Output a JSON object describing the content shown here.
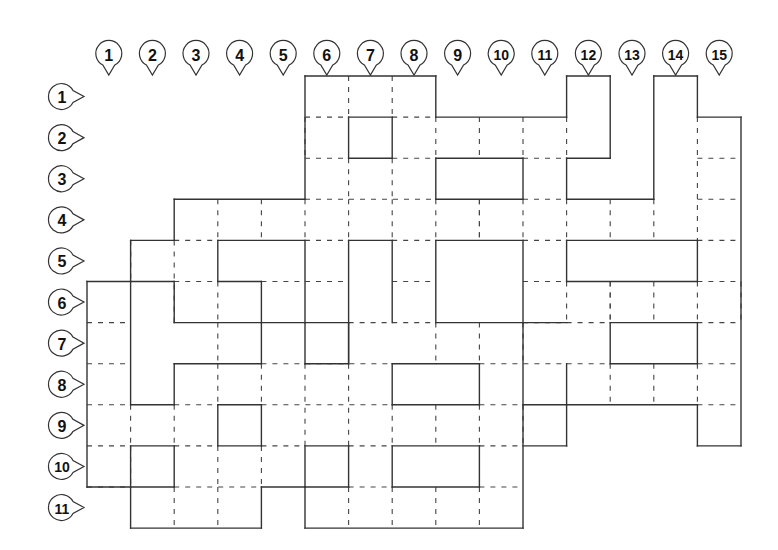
{
  "diagram": {
    "type": "seating-grid",
    "grid": {
      "origin_x": 87,
      "origin_y": 76,
      "col_width": 43.6,
      "row_height": 41.1,
      "cols": 15,
      "rows": 11
    },
    "column_labels": [
      "1",
      "2",
      "3",
      "4",
      "5",
      "6",
      "7",
      "8",
      "9",
      "10",
      "11",
      "12",
      "13",
      "14",
      "15"
    ],
    "row_labels": [
      "1",
      "2",
      "3",
      "4",
      "5",
      "6",
      "7",
      "8",
      "9",
      "10",
      "11"
    ],
    "colors": {
      "line": "#333333",
      "background": "#ffffff",
      "label_text": "#111111"
    },
    "solid_segments": [
      [
        5,
        0,
        8,
        0
      ],
      [
        8,
        0,
        8,
        1
      ],
      [
        8,
        1,
        11,
        1
      ],
      [
        11,
        0,
        12,
        0
      ],
      [
        12,
        0,
        12,
        2
      ],
      [
        11,
        2,
        12,
        2
      ],
      [
        11,
        0,
        11,
        1
      ],
      [
        11,
        2,
        11,
        3
      ],
      [
        11,
        3,
        13,
        3
      ],
      [
        13,
        0,
        13,
        3
      ],
      [
        13,
        0,
        14,
        0
      ],
      [
        14,
        0,
        14,
        1
      ],
      [
        14,
        1,
        15,
        1
      ],
      [
        15,
        1,
        15,
        9
      ],
      [
        14,
        9,
        15,
        9
      ],
      [
        14,
        8,
        14,
        9
      ],
      [
        11,
        8,
        14,
        8
      ],
      [
        10,
        8,
        11,
        8
      ],
      [
        11,
        7,
        11,
        9
      ],
      [
        10,
        9,
        11,
        9
      ],
      [
        10,
        6,
        11,
        6
      ],
      [
        10,
        6,
        10,
        11
      ],
      [
        5,
        11,
        10,
        11
      ],
      [
        5,
        10,
        5,
        11
      ],
      [
        4,
        10,
        5,
        10
      ],
      [
        4,
        10,
        4,
        11
      ],
      [
        1,
        11,
        4,
        11
      ],
      [
        1,
        10,
        1,
        11
      ],
      [
        0,
        10,
        2,
        10
      ],
      [
        0,
        5,
        0,
        10
      ],
      [
        0,
        5,
        1,
        5
      ],
      [
        1,
        4,
        1,
        5
      ],
      [
        1,
        4,
        2,
        4
      ],
      [
        2,
        3,
        2,
        4
      ],
      [
        2,
        3,
        5,
        3
      ],
      [
        5,
        0,
        5,
        3
      ],
      [
        6,
        1,
        7,
        1
      ],
      [
        6,
        1,
        6,
        2
      ],
      [
        7,
        1,
        7,
        2
      ],
      [
        6,
        2,
        7,
        2
      ],
      [
        8,
        2,
        10,
        2
      ],
      [
        8,
        2,
        8,
        3
      ],
      [
        10,
        2,
        10,
        3
      ],
      [
        8,
        3,
        10,
        3
      ],
      [
        3,
        4,
        5,
        4
      ],
      [
        3,
        4,
        3,
        5
      ],
      [
        3,
        5,
        4,
        5
      ],
      [
        4,
        5,
        4,
        6
      ],
      [
        4,
        6,
        5,
        6
      ],
      [
        5,
        4,
        5,
        6
      ],
      [
        6,
        4,
        7,
        4
      ],
      [
        6,
        4,
        6,
        7
      ],
      [
        7,
        4,
        7,
        6
      ],
      [
        8,
        4,
        10,
        4
      ],
      [
        8,
        4,
        8,
        6
      ],
      [
        10,
        4,
        10,
        6
      ],
      [
        8,
        6,
        10,
        6
      ],
      [
        11,
        4,
        14,
        4
      ],
      [
        11,
        4,
        11,
        5
      ],
      [
        14,
        4,
        14,
        5
      ],
      [
        11,
        5,
        14,
        5
      ],
      [
        1,
        5,
        2,
        5
      ],
      [
        1,
        5,
        1,
        8
      ],
      [
        2,
        5,
        2,
        6
      ],
      [
        2,
        6,
        4,
        6
      ],
      [
        4,
        6,
        4,
        7
      ],
      [
        2,
        7,
        4,
        7
      ],
      [
        2,
        7,
        2,
        8
      ],
      [
        1,
        8,
        2,
        8
      ],
      [
        5,
        6,
        6,
        6
      ],
      [
        5,
        6,
        5,
        7
      ],
      [
        5,
        7,
        6,
        7
      ],
      [
        6,
        6,
        6,
        7
      ],
      [
        7,
        7,
        9,
        7
      ],
      [
        7,
        7,
        7,
        8
      ],
      [
        9,
        7,
        9,
        8
      ],
      [
        7,
        8,
        9,
        8
      ],
      [
        12,
        6,
        14,
        6
      ],
      [
        12,
        6,
        12,
        7
      ],
      [
        14,
        6,
        14,
        7
      ],
      [
        12,
        7,
        14,
        7
      ],
      [
        3,
        8,
        4,
        8
      ],
      [
        3,
        8,
        3,
        9
      ],
      [
        4,
        8,
        4,
        9
      ],
      [
        3,
        9,
        4,
        9
      ],
      [
        1,
        9,
        2,
        9
      ],
      [
        1,
        9,
        1,
        10
      ],
      [
        2,
        9,
        2,
        10
      ],
      [
        5,
        9,
        6,
        9
      ],
      [
        5,
        9,
        5,
        10
      ],
      [
        6,
        9,
        6,
        10
      ],
      [
        5,
        10,
        6,
        10
      ],
      [
        7,
        9,
        9,
        9
      ],
      [
        7,
        9,
        7,
        10
      ],
      [
        9,
        9,
        9,
        10
      ],
      [
        7,
        10,
        9,
        10
      ]
    ],
    "dashed_segments": [
      [
        5,
        1,
        6,
        1
      ],
      [
        7,
        1,
        8,
        1
      ],
      [
        6,
        0,
        6,
        1
      ],
      [
        7,
        0,
        7,
        1
      ],
      [
        5,
        2,
        6,
        2
      ],
      [
        7,
        2,
        8,
        2
      ],
      [
        10,
        2,
        11,
        2
      ],
      [
        9,
        1,
        9,
        2
      ],
      [
        10,
        1,
        10,
        2
      ],
      [
        11,
        1,
        11,
        2
      ],
      [
        6,
        2,
        6,
        3
      ],
      [
        7,
        2,
        7,
        3
      ],
      [
        8,
        1,
        8,
        2
      ],
      [
        5,
        1,
        5,
        2
      ],
      [
        14,
        2,
        15,
        2
      ],
      [
        14,
        3,
        15,
        3
      ],
      [
        14,
        1,
        14,
        4
      ],
      [
        12,
        3,
        12,
        4
      ],
      [
        13,
        3,
        13,
        4
      ],
      [
        2,
        4,
        3,
        4
      ],
      [
        5,
        3,
        8,
        3
      ],
      [
        10,
        3,
        11,
        3
      ],
      [
        3,
        3,
        3,
        4
      ],
      [
        4,
        3,
        4,
        4
      ],
      [
        5,
        3,
        5,
        4
      ],
      [
        6,
        3,
        6,
        4
      ],
      [
        7,
        3,
        7,
        4
      ],
      [
        8,
        3,
        8,
        4
      ],
      [
        9,
        3,
        9,
        4
      ],
      [
        10,
        3,
        10,
        4
      ],
      [
        11,
        3,
        11,
        4
      ],
      [
        2,
        5,
        3,
        5
      ],
      [
        5,
        4,
        6,
        4
      ],
      [
        7,
        4,
        8,
        4
      ],
      [
        10,
        4,
        11,
        4
      ],
      [
        14,
        4,
        15,
        4
      ],
      [
        1,
        4,
        1,
        5
      ],
      [
        2,
        4,
        2,
        6
      ],
      [
        3,
        5,
        3,
        6
      ],
      [
        9,
        3,
        9,
        4
      ],
      [
        11,
        5,
        11,
        6
      ],
      [
        14,
        5,
        14,
        6
      ],
      [
        15,
        5,
        15,
        6
      ],
      [
        0,
        6,
        1,
        6
      ],
      [
        2,
        6,
        2,
        6
      ],
      [
        5,
        5,
        6,
        5
      ],
      [
        7,
        5,
        8,
        5
      ],
      [
        10,
        5,
        11,
        5
      ],
      [
        14,
        5,
        15,
        5
      ],
      [
        4,
        5,
        5,
        5
      ],
      [
        5,
        6,
        5,
        6
      ],
      [
        3,
        6,
        3,
        7
      ],
      [
        1,
        4,
        1,
        5
      ],
      [
        12,
        5,
        12,
        6
      ],
      [
        13,
        5,
        13,
        6
      ],
      [
        0,
        7,
        1,
        7
      ],
      [
        6,
        6,
        7,
        6
      ],
      [
        7,
        6,
        8,
        6
      ],
      [
        10,
        6,
        11,
        6
      ],
      [
        11,
        6,
        12,
        6
      ],
      [
        14,
        6,
        15,
        6
      ],
      [
        8,
        6,
        8,
        7
      ],
      [
        9,
        6,
        9,
        7
      ],
      [
        10,
        6,
        10,
        7
      ],
      [
        12,
        5,
        12,
        6
      ],
      [
        0,
        8,
        1,
        8
      ],
      [
        4,
        7,
        7,
        7
      ],
      [
        9,
        7,
        11,
        7
      ],
      [
        11,
        7,
        12,
        7
      ],
      [
        14,
        7,
        15,
        7
      ],
      [
        3,
        7,
        3,
        8
      ],
      [
        4,
        7,
        4,
        8
      ],
      [
        5,
        7,
        5,
        9
      ],
      [
        6,
        7,
        6,
        9
      ],
      [
        8,
        8,
        8,
        9
      ],
      [
        9,
        8,
        9,
        9
      ],
      [
        12,
        7,
        12,
        8
      ],
      [
        13,
        7,
        13,
        8
      ],
      [
        14,
        7,
        14,
        8
      ],
      [
        0,
        9,
        1,
        9
      ],
      [
        2,
        8,
        3,
        8
      ],
      [
        4,
        8,
        7,
        8
      ],
      [
        9,
        8,
        10,
        8
      ],
      [
        14,
        8,
        15,
        8
      ],
      [
        1,
        8,
        1,
        9
      ],
      [
        2,
        8,
        2,
        9
      ],
      [
        3,
        8,
        3,
        8
      ],
      [
        7,
        8,
        7,
        9
      ],
      [
        10,
        8,
        10,
        9
      ],
      [
        0,
        10,
        1,
        10
      ],
      [
        2,
        9,
        3,
        9
      ],
      [
        4,
        9,
        5,
        9
      ],
      [
        6,
        9,
        7,
        9
      ],
      [
        9,
        9,
        10,
        9
      ],
      [
        1,
        9,
        1,
        10
      ],
      [
        3,
        9,
        3,
        10
      ],
      [
        4,
        9,
        4,
        10
      ],
      [
        2,
        10,
        2,
        10
      ],
      [
        2,
        10,
        4,
        10
      ],
      [
        6,
        10,
        7,
        10
      ],
      [
        9,
        10,
        10,
        10
      ],
      [
        2,
        10,
        2,
        11
      ],
      [
        3,
        10,
        3,
        11
      ],
      [
        6,
        10,
        6,
        11
      ],
      [
        7,
        10,
        7,
        11
      ],
      [
        8,
        10,
        8,
        11
      ],
      [
        9,
        10,
        9,
        11
      ]
    ]
  }
}
